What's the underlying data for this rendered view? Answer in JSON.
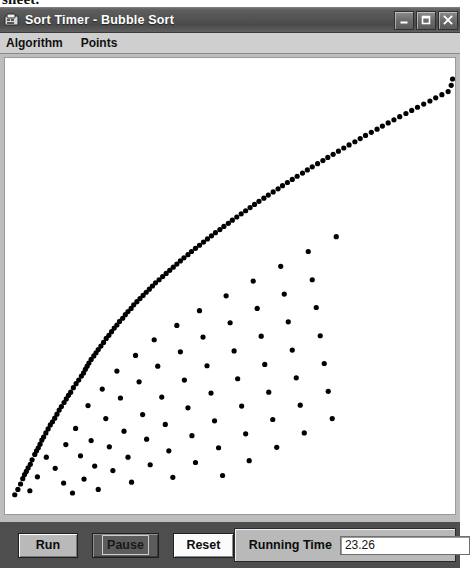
{
  "document_fragment": {
    "text": "sheet."
  },
  "window": {
    "title": "Sort Timer - Bubble Sort",
    "icon": "application-icon",
    "controls": {
      "minimize_label": "Minimize",
      "maximize_label": "Maximize",
      "close_label": "Close"
    }
  },
  "menu": {
    "items": [
      {
        "label": "Algorithm"
      },
      {
        "label": "Points"
      }
    ]
  },
  "toolbar": {
    "run_label": "Run",
    "pause_label": "Pause",
    "reset_label": "Reset",
    "timer_label": "Running Time",
    "timer_value": "23.26"
  },
  "colors": {
    "title_bar": "#525252",
    "menu_bar": "#cfcfcf",
    "window_face": "#bdbdbd",
    "control_bar": "#4e4e4e",
    "plot_background": "#ffffff",
    "point_color": "#000000"
  },
  "chart_data": {
    "type": "scatter",
    "title": "",
    "xlabel": "",
    "ylabel": "",
    "grid": false,
    "legend": null,
    "xlim": [
      0,
      1
    ],
    "ylim": [
      0,
      1
    ],
    "point_color": "#000000",
    "point_radius": 2.6,
    "background": "#ffffff",
    "series": [
      {
        "name": "envelope",
        "points": [
          [
            0.013,
            0.034
          ],
          [
            0.02,
            0.046
          ],
          [
            0.026,
            0.058
          ],
          [
            0.031,
            0.07
          ],
          [
            0.035,
            0.079
          ],
          [
            0.039,
            0.086
          ],
          [
            0.043,
            0.094
          ],
          [
            0.048,
            0.102
          ],
          [
            0.052,
            0.112
          ],
          [
            0.058,
            0.124
          ],
          [
            0.062,
            0.132
          ],
          [
            0.066,
            0.139
          ],
          [
            0.07,
            0.147
          ],
          [
            0.074,
            0.156
          ],
          [
            0.078,
            0.163
          ],
          [
            0.083,
            0.172
          ],
          [
            0.088,
            0.181
          ],
          [
            0.093,
            0.19
          ],
          [
            0.098,
            0.197
          ],
          [
            0.103,
            0.205
          ],
          [
            0.108,
            0.214
          ],
          [
            0.113,
            0.223
          ],
          [
            0.118,
            0.231
          ],
          [
            0.124,
            0.24
          ],
          [
            0.129,
            0.248
          ],
          [
            0.134,
            0.256
          ],
          [
            0.139,
            0.263
          ],
          [
            0.145,
            0.273
          ],
          [
            0.151,
            0.282
          ],
          [
            0.157,
            0.29
          ],
          [
            0.163,
            0.299
          ],
          [
            0.168,
            0.306
          ],
          [
            0.172,
            0.314
          ],
          [
            0.176,
            0.321
          ],
          [
            0.18,
            0.328
          ],
          [
            0.185,
            0.336
          ],
          [
            0.191,
            0.344
          ],
          [
            0.196,
            0.351
          ],
          [
            0.201,
            0.358
          ],
          [
            0.207,
            0.366
          ],
          [
            0.213,
            0.374
          ],
          [
            0.219,
            0.383
          ],
          [
            0.225,
            0.39
          ],
          [
            0.231,
            0.398
          ],
          [
            0.237,
            0.406
          ],
          [
            0.243,
            0.413
          ],
          [
            0.249,
            0.421
          ],
          [
            0.256,
            0.428
          ],
          [
            0.262,
            0.436
          ],
          [
            0.268,
            0.443
          ],
          [
            0.275,
            0.45
          ],
          [
            0.281,
            0.458
          ],
          [
            0.288,
            0.465
          ],
          [
            0.295,
            0.472
          ],
          [
            0.302,
            0.479
          ],
          [
            0.309,
            0.486
          ],
          [
            0.316,
            0.493
          ],
          [
            0.323,
            0.5
          ],
          [
            0.33,
            0.507
          ],
          [
            0.338,
            0.514
          ],
          [
            0.346,
            0.521
          ],
          [
            0.354,
            0.528
          ],
          [
            0.362,
            0.535
          ],
          [
            0.37,
            0.542
          ],
          [
            0.378,
            0.549
          ],
          [
            0.386,
            0.556
          ],
          [
            0.394,
            0.563
          ],
          [
            0.403,
            0.57
          ],
          [
            0.411,
            0.577
          ],
          [
            0.42,
            0.584
          ],
          [
            0.429,
            0.591
          ],
          [
            0.438,
            0.598
          ],
          [
            0.447,
            0.605
          ],
          [
            0.456,
            0.612
          ],
          [
            0.465,
            0.619
          ],
          [
            0.475,
            0.626
          ],
          [
            0.484,
            0.633
          ],
          [
            0.494,
            0.64
          ],
          [
            0.503,
            0.647
          ],
          [
            0.513,
            0.654
          ],
          [
            0.523,
            0.661
          ],
          [
            0.533,
            0.668
          ],
          [
            0.543,
            0.675
          ],
          [
            0.553,
            0.682
          ],
          [
            0.563,
            0.689
          ],
          [
            0.574,
            0.696
          ],
          [
            0.584,
            0.703
          ],
          [
            0.595,
            0.71
          ],
          [
            0.606,
            0.717
          ],
          [
            0.616,
            0.724
          ],
          [
            0.627,
            0.731
          ],
          [
            0.638,
            0.738
          ],
          [
            0.649,
            0.745
          ],
          [
            0.661,
            0.752
          ],
          [
            0.672,
            0.759
          ],
          [
            0.683,
            0.766
          ],
          [
            0.695,
            0.773
          ],
          [
            0.707,
            0.78
          ],
          [
            0.718,
            0.787
          ],
          [
            0.73,
            0.794
          ],
          [
            0.742,
            0.801
          ],
          [
            0.754,
            0.808
          ],
          [
            0.766,
            0.815
          ],
          [
            0.779,
            0.822
          ],
          [
            0.791,
            0.829
          ],
          [
            0.803,
            0.836
          ],
          [
            0.816,
            0.843
          ],
          [
            0.829,
            0.85
          ],
          [
            0.841,
            0.857
          ],
          [
            0.854,
            0.864
          ],
          [
            0.867,
            0.871
          ],
          [
            0.88,
            0.878
          ],
          [
            0.894,
            0.885
          ],
          [
            0.907,
            0.892
          ],
          [
            0.92,
            0.899
          ],
          [
            0.934,
            0.906
          ],
          [
            0.948,
            0.913
          ],
          [
            0.961,
            0.92
          ],
          [
            0.975,
            0.927
          ],
          [
            0.989,
            0.934
          ],
          [
            0.996,
            0.948
          ],
          [
            0.999,
            0.962
          ]
        ]
      },
      {
        "name": "scatter",
        "points": [
          [
            0.047,
            0.043
          ],
          [
            0.064,
            0.074
          ],
          [
            0.084,
            0.118
          ],
          [
            0.104,
            0.093
          ],
          [
            0.123,
            0.06
          ],
          [
            0.128,
            0.146
          ],
          [
            0.143,
            0.038
          ],
          [
            0.15,
            0.182
          ],
          [
            0.161,
            0.121
          ],
          [
            0.169,
            0.069
          ],
          [
            0.178,
            0.233
          ],
          [
            0.185,
            0.155
          ],
          [
            0.193,
            0.098
          ],
          [
            0.201,
            0.046
          ],
          [
            0.21,
            0.27
          ],
          [
            0.218,
            0.204
          ],
          [
            0.226,
            0.141
          ],
          [
            0.234,
            0.088
          ],
          [
            0.243,
            0.31
          ],
          [
            0.251,
            0.25
          ],
          [
            0.259,
            0.176
          ],
          [
            0.268,
            0.118
          ],
          [
            0.276,
            0.062
          ],
          [
            0.285,
            0.345
          ],
          [
            0.293,
            0.286
          ],
          [
            0.301,
            0.213
          ],
          [
            0.31,
            0.158
          ],
          [
            0.318,
            0.101
          ],
          [
            0.327,
            0.38
          ],
          [
            0.335,
            0.321
          ],
          [
            0.344,
            0.252
          ],
          [
            0.352,
            0.191
          ],
          [
            0.36,
            0.132
          ],
          [
            0.369,
            0.073
          ],
          [
            0.378,
            0.412
          ],
          [
            0.386,
            0.353
          ],
          [
            0.395,
            0.29
          ],
          [
            0.403,
            0.228
          ],
          [
            0.412,
            0.166
          ],
          [
            0.42,
            0.106
          ],
          [
            0.429,
            0.445
          ],
          [
            0.437,
            0.386
          ],
          [
            0.446,
            0.322
          ],
          [
            0.455,
            0.261
          ],
          [
            0.463,
            0.199
          ],
          [
            0.472,
            0.139
          ],
          [
            0.481,
            0.077
          ],
          [
            0.489,
            0.478
          ],
          [
            0.498,
            0.418
          ],
          [
            0.507,
            0.355
          ],
          [
            0.515,
            0.293
          ],
          [
            0.524,
            0.232
          ],
          [
            0.533,
            0.17
          ],
          [
            0.541,
            0.11
          ],
          [
            0.55,
            0.511
          ],
          [
            0.559,
            0.45
          ],
          [
            0.568,
            0.388
          ],
          [
            0.576,
            0.325
          ],
          [
            0.585,
            0.263
          ],
          [
            0.594,
            0.202
          ],
          [
            0.603,
            0.14
          ],
          [
            0.612,
            0.544
          ],
          [
            0.62,
            0.482
          ],
          [
            0.629,
            0.42
          ],
          [
            0.638,
            0.357
          ],
          [
            0.647,
            0.295
          ],
          [
            0.656,
            0.234
          ],
          [
            0.665,
            0.172
          ],
          [
            0.674,
            0.577
          ],
          [
            0.683,
            0.514
          ],
          [
            0.692,
            0.452
          ],
          [
            0.701,
            0.389
          ],
          [
            0.71,
            0.327
          ],
          [
            0.719,
            0.265
          ],
          [
            0.728,
            0.204
          ],
          [
            0.737,
            0.61
          ]
        ]
      }
    ]
  }
}
